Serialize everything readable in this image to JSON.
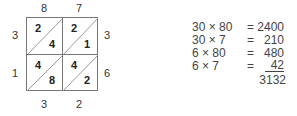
{
  "lattice": {
    "top_labels": [
      "8",
      "7"
    ],
    "left_labels": [
      "3",
      "1"
    ],
    "right_labels": [
      "3",
      "6"
    ],
    "bottom_labels": [
      "3",
      "2"
    ],
    "cells": [
      [
        {
          "tens": "2",
          "ones": "4"
        },
        {
          "tens": "2",
          "ones": "1"
        }
      ],
      [
        {
          "tens": "4",
          "ones": "8"
        },
        {
          "tens": "4",
          "ones": "2"
        }
      ]
    ]
  },
  "partial_products": [
    {
      "expr": "30 × 80",
      "eq": "=",
      "value": "2400"
    },
    {
      "expr": "30 × 7",
      "eq": "=",
      "value": "210"
    },
    {
      "expr": "6 × 80",
      "eq": "=",
      "value": "480"
    },
    {
      "expr": "6 × 7",
      "eq": "=",
      "value": "42"
    }
  ],
  "total": "3132"
}
